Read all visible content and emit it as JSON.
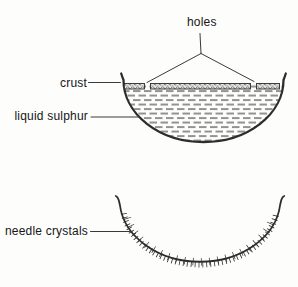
{
  "labels": {
    "holes": "holes",
    "crust": "crust",
    "liquid_sulphur": "liquid sulphur",
    "needle_crystals": "needle crystals"
  },
  "colors": {
    "ink": "#2d2d2d",
    "pointer": "#3a3a3a",
    "text": "#161616",
    "background": "#fdfdfc",
    "crust_base": "#e8e6e1",
    "crust_speckle": "#4a4a4a",
    "liquid_dash": "#3c3c3c"
  }
}
